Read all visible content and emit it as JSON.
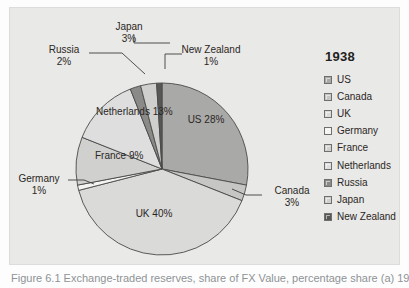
{
  "figure": {
    "panel_bg": "#e9e9e7",
    "caption": "Figure 6.1  Exchange-traded reserves, share of FX Value, percentage share (a) 1938"
  },
  "legend": {
    "title": "1938",
    "items": [
      {
        "label": "US",
        "color": "#a9a9a8"
      },
      {
        "label": "Canada",
        "color": "#c6c6c4"
      },
      {
        "label": "UK",
        "color": "#dadad8"
      },
      {
        "label": "Germany",
        "color": "#f4f4f2"
      },
      {
        "label": "France",
        "color": "#d0d0ce"
      },
      {
        "label": "Netherlands",
        "color": "#dedede"
      },
      {
        "label": "Russia",
        "color": "#8a8a89"
      },
      {
        "label": "Japan",
        "color": "#cfcfcd"
      },
      {
        "label": "New Zealand",
        "color": "#575757"
      }
    ]
  },
  "chart_data": {
    "type": "pie",
    "title": "1938",
    "xlabel": "",
    "ylabel": "",
    "unit": "percent",
    "start_angle_deg": 0,
    "direction": "clockwise",
    "categories": [
      "US",
      "Canada",
      "UK",
      "Germany",
      "France",
      "Netherlands",
      "Russia",
      "Japan",
      "New Zealand"
    ],
    "values": [
      28,
      3,
      40,
      1,
      9,
      13,
      2,
      3,
      1
    ],
    "labels": [
      "28%",
      "3%",
      "40%",
      "1%",
      "9%",
      "13%",
      "2%",
      "3%",
      "1%"
    ],
    "colors": [
      "#a9a9a8",
      "#c6c6c4",
      "#dadad8",
      "#f4f4f2",
      "#d0d0ce",
      "#dedede",
      "#8a8a89",
      "#cfcfcd",
      "#575757"
    ],
    "slice_outline": "#4a4a4a",
    "legend_position": "right",
    "grid": false
  },
  "pie_labels": {
    "us": {
      "name": "US",
      "pct": "28%"
    },
    "canada": {
      "name": "Canada",
      "pct": "3%"
    },
    "uk": {
      "name": "UK",
      "pct": "40%"
    },
    "germany": {
      "name": "Germany",
      "pct": "1%"
    },
    "france": {
      "name": "France",
      "pct": "9%"
    },
    "netherlands": {
      "name": "Netherlands",
      "pct": "13%"
    },
    "russia": {
      "name": "Russia",
      "pct": "2%"
    },
    "japan": {
      "name": "Japan",
      "pct": "3%"
    },
    "newzealand": {
      "name": "New Zealand",
      "pct": "1%"
    }
  }
}
